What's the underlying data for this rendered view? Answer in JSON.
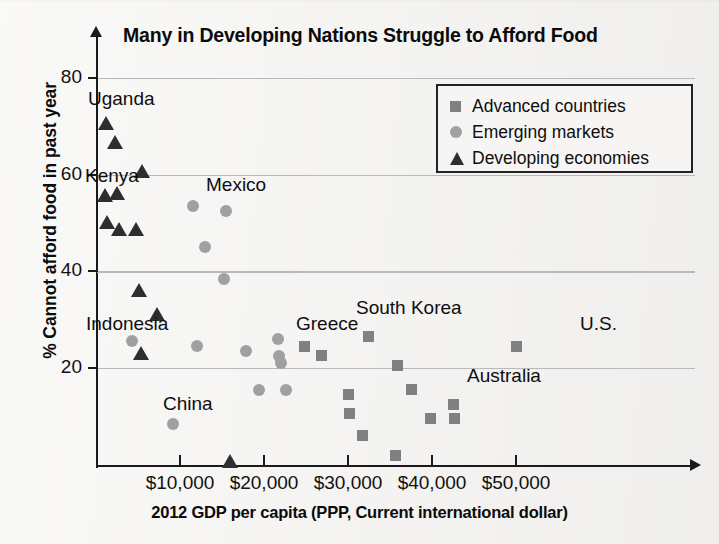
{
  "chart_data": {
    "type": "scatter",
    "title": "Many in Developing Nations Struggle to Afford Food",
    "xlabel": "2012 GDP per capita (PPP, Current international dollar)",
    "ylabel": "% Cannot afford food in past year",
    "xlim": [
      0,
      57000
    ],
    "ylim": [
      0,
      85
    ],
    "xticks": [
      10000,
      20000,
      30000,
      40000,
      50000
    ],
    "xtick_labels": [
      "$10,000",
      "$20,000",
      "$30,000",
      "$40,000",
      "$50,000"
    ],
    "yticks": [
      20,
      40,
      60,
      80
    ],
    "ytick_labels": [
      "20",
      "40",
      "60",
      "80"
    ],
    "grid": "horizontal",
    "legend_position": "top-right",
    "series": [
      {
        "name": "Advanced countries",
        "marker": "square",
        "color": "#808080",
        "points": [
          {
            "x": 24800,
            "y": 24.5
          },
          {
            "x": 26900,
            "y": 22.5
          },
          {
            "x": 30100,
            "y": 14.5
          },
          {
            "x": 30200,
            "y": 10.5
          },
          {
            "x": 31700,
            "y": 6.0
          },
          {
            "x": 32400,
            "y": 26.5
          },
          {
            "x": 35600,
            "y": 2.0
          },
          {
            "x": 35900,
            "y": 20.5
          },
          {
            "x": 37500,
            "y": 15.5
          },
          {
            "x": 39800,
            "y": 9.5
          },
          {
            "x": 42500,
            "y": 12.5
          },
          {
            "x": 42700,
            "y": 9.5
          },
          {
            "x": 50000,
            "y": 24.5
          }
        ]
      },
      {
        "name": "Emerging markets",
        "marker": "circle",
        "color": "#a0a0a0",
        "points": [
          {
            "x": 4300,
            "y": 25.5
          },
          {
            "x": 9200,
            "y": 8.5
          },
          {
            "x": 11500,
            "y": 53.5
          },
          {
            "x": 12000,
            "y": 24.5
          },
          {
            "x": 13000,
            "y": 45.0
          },
          {
            "x": 15200,
            "y": 38.5
          },
          {
            "x": 15500,
            "y": 52.5
          },
          {
            "x": 17800,
            "y": 23.5
          },
          {
            "x": 19400,
            "y": 15.5
          },
          {
            "x": 21700,
            "y": 26.0
          },
          {
            "x": 21800,
            "y": 22.5
          },
          {
            "x": 22000,
            "y": 21.0
          },
          {
            "x": 22600,
            "y": 15.5
          }
        ]
      },
      {
        "name": "Developing economies",
        "marker": "triangle",
        "color": "#2e2e2e",
        "points": [
          {
            "x": 1200,
            "y": 70.5
          },
          {
            "x": 2300,
            "y": 66.5
          },
          {
            "x": 1100,
            "y": 55.5
          },
          {
            "x": 2500,
            "y": 56.0
          },
          {
            "x": 1300,
            "y": 50.0
          },
          {
            "x": 2700,
            "y": 48.5
          },
          {
            "x": 4800,
            "y": 48.5
          },
          {
            "x": 5500,
            "y": 60.5
          },
          {
            "x": 5100,
            "y": 36.0
          },
          {
            "x": 7300,
            "y": 31.0
          },
          {
            "x": 5400,
            "y": 23.0
          },
          {
            "x": 16000,
            "y": 0.5
          }
        ]
      }
    ],
    "annotations": [
      {
        "label": "Uganda",
        "px": 88,
        "py": 88
      },
      {
        "label": "Kenya",
        "px": 85,
        "py": 165
      },
      {
        "label": "Mexico",
        "px": 206,
        "py": 174
      },
      {
        "label": "Indonesia",
        "px": 86,
        "py": 313
      },
      {
        "label": "China",
        "px": 163,
        "py": 393
      },
      {
        "label": "Greece",
        "px": 296,
        "py": 313
      },
      {
        "label": "South Korea",
        "px": 356,
        "py": 297
      },
      {
        "label": "Australia",
        "px": 467,
        "py": 365
      },
      {
        "label": "U.S.",
        "px": 580,
        "py": 313
      }
    ]
  }
}
